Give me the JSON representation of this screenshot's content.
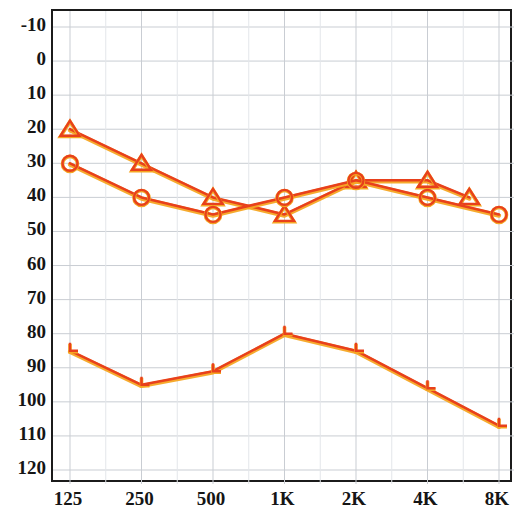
{
  "chart_data": {
    "type": "line",
    "title": "",
    "xlabel": "",
    "ylabel": "",
    "x_tick_labels": [
      "125",
      "250",
      "500",
      "1K",
      "2K",
      "4K",
      "8K"
    ],
    "x_tick_frequencies": [
      125,
      250,
      500,
      1000,
      2000,
      4000,
      8000
    ],
    "y_tick_labels": [
      "-10",
      "0",
      "10",
      "20",
      "30",
      "40",
      "50",
      "60",
      "70",
      "80",
      "90",
      "100",
      "110",
      "120"
    ],
    "ylim": [
      -10,
      120
    ],
    "y_axis_inverted": true,
    "grid": true,
    "grid_minor": true,
    "legend_position": "none",
    "series": [
      {
        "name": "triangle-series",
        "marker": "triangle",
        "color": "#E8401C",
        "points": [
          {
            "x_label": "125",
            "freq": 125,
            "value": 20
          },
          {
            "x_label": "250",
            "freq": 250,
            "value": 30
          },
          {
            "x_label": "500",
            "freq": 500,
            "value": 40
          },
          {
            "x_label": "1K",
            "freq": 1000,
            "value": 45
          },
          {
            "x_label": "2K",
            "freq": 2000,
            "value": 35
          },
          {
            "x_label": "4K",
            "freq": 4000,
            "value": 35
          },
          {
            "x_label": "6K",
            "freq": 6000,
            "value": 40
          }
        ]
      },
      {
        "name": "circle-series",
        "marker": "circle",
        "color": "#E8401C",
        "points": [
          {
            "x_label": "125",
            "freq": 125,
            "value": 30
          },
          {
            "x_label": "250",
            "freq": 250,
            "value": 40
          },
          {
            "x_label": "500",
            "freq": 500,
            "value": 45
          },
          {
            "x_label": "1K",
            "freq": 1000,
            "value": 40
          },
          {
            "x_label": "2K",
            "freq": 2000,
            "value": 35
          },
          {
            "x_label": "4K",
            "freq": 4000,
            "value": 40
          },
          {
            "x_label": "8K",
            "freq": 8000,
            "value": 45
          }
        ]
      },
      {
        "name": "bracket-series",
        "marker": "bracket",
        "color": "#E8401C",
        "points": [
          {
            "x_label": "125",
            "freq": 125,
            "value": 85
          },
          {
            "x_label": "250",
            "freq": 250,
            "value": 95
          },
          {
            "x_label": "500",
            "freq": 500,
            "value": 91
          },
          {
            "x_label": "1K",
            "freq": 1000,
            "value": 80
          },
          {
            "x_label": "2K",
            "freq": 2000,
            "value": 85
          },
          {
            "x_label": "4K",
            "freq": 4000,
            "value": 96
          },
          {
            "x_label": "8K",
            "freq": 8000,
            "value": 107
          }
        ]
      }
    ],
    "colors": {
      "series_line": "#E8401C",
      "series_highlight": "#F5A623",
      "grid_major": "#c9cdd3",
      "grid_minor": "#e3e6ea",
      "frame": "#1b1b1b",
      "tick_text": "#151515",
      "background": "#ffffff"
    }
  }
}
